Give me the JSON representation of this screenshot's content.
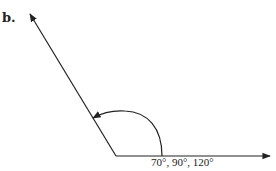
{
  "figure_label": "b.",
  "angle_caption": "70°, 90°, 120°",
  "diagram": {
    "type": "angle",
    "rays": [
      "horizontal-right",
      "upper-left"
    ],
    "rotation": "counterclockwise",
    "colors": {
      "stroke": "#222222",
      "background": "#ffffff"
    }
  }
}
